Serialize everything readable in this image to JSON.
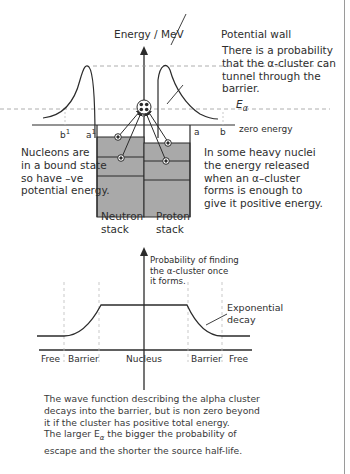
{
  "top_diagram": {
    "y_axis_label": "Energy / MeV",
    "potential_wall_label": "Potential wall",
    "tunnel_note": [
      "There is a probability",
      "that the α-cluster can",
      "tunnel through the",
      "barrier."
    ],
    "energy_label": "E",
    "energy_subscript": "α",
    "zero_energy_label": "zero energy",
    "x_markers": {
      "b1": "b",
      "b1_sup": "1",
      "a1": "a",
      "a1_sup": "1",
      "a": "a",
      "b": "b"
    },
    "left_note": [
      "Nucleons are",
      "in a bound state",
      "so have –ve",
      "potential energy."
    ],
    "right_note": [
      "In some heavy nuclei",
      "the energy released",
      "when an α–cluster",
      "forms is enough to",
      "give it positive energy."
    ],
    "neutron_stack_label": [
      "Neutron",
      "stack"
    ],
    "proton_stack_label": [
      "Proton",
      "stack"
    ],
    "colors": {
      "stack_fill": "#a9a9a9",
      "line": "#2b2b2b",
      "dashed": "#9a9a9a"
    }
  },
  "bottom_diagram": {
    "y_axis_label": [
      "Probability of finding",
      "the α-cluster once",
      "it forms."
    ],
    "curve_note": [
      "Exponential",
      "decay"
    ],
    "regions": [
      "Free",
      "Barrier",
      "Nucleus",
      "Barrier",
      "Free"
    ]
  },
  "caption": [
    "The wave function describing the alpha cluster",
    "decays into the barrier, but is non zero beyond",
    "it if the cluster has positive total energy.",
    "The larger E",
    "α",
    " the bigger the probability of",
    "escape and the shorter the source half-life."
  ]
}
